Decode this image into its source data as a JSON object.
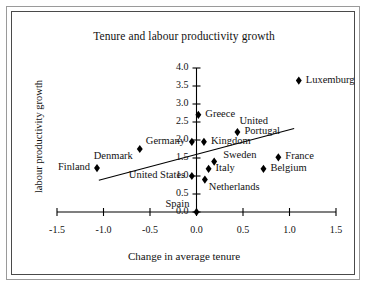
{
  "chart_data": {
    "type": "scatter",
    "title": "Tenure and labour productivity growth",
    "xlabel": "Change in average tenure",
    "ylabel": "labour productivity growth",
    "xlim": [
      -1.5,
      1.5
    ],
    "ylim": [
      0.0,
      4.0
    ],
    "xticks": [
      "-1.5",
      "-1.0",
      "-0.5",
      "0.0",
      "0.5",
      "1.0",
      "1.5"
    ],
    "xtick_values": [
      -1.5,
      -1.0,
      -0.5,
      0.0,
      0.5,
      1.0,
      1.5
    ],
    "yticks": [
      "0.0",
      "0.5",
      "1.0",
      "1.5",
      "2.0",
      "2.5",
      "3.0",
      "3.5",
      "4.0"
    ],
    "ytick_values": [
      0.0,
      0.5,
      1.0,
      1.5,
      2.0,
      2.5,
      3.0,
      3.5,
      4.0
    ],
    "grid": false,
    "legend": "none",
    "marker": "diamond",
    "marker_color": "#000000",
    "points": [
      {
        "label": "Luxemburg",
        "x": 1.1,
        "y": 3.65,
        "label_pos": "right"
      },
      {
        "label": "Greece",
        "x": 0.02,
        "y": 2.7,
        "label_pos": "right"
      },
      {
        "label": "Portugal",
        "x": 0.44,
        "y": 2.22,
        "label_pos": "right"
      },
      {
        "label": "United",
        "x": 0.44,
        "y": 2.22,
        "label_pos": "above-left"
      },
      {
        "label": "Kingdom",
        "x": 0.08,
        "y": 1.95,
        "label_pos": "right"
      },
      {
        "label": "Germany",
        "x": -0.05,
        "y": 1.95,
        "label_pos": "left"
      },
      {
        "label": "Denmark",
        "x": -0.61,
        "y": 1.75,
        "label_pos": "left-below"
      },
      {
        "label": "France",
        "x": 0.88,
        "y": 1.52,
        "label_pos": "right"
      },
      {
        "label": "Sweden",
        "x": 0.19,
        "y": 1.4,
        "label_pos": "right-above"
      },
      {
        "label": "Belgium",
        "x": 0.72,
        "y": 1.2,
        "label_pos": "right"
      },
      {
        "label": "Italy",
        "x": 0.13,
        "y": 1.2,
        "label_pos": "right"
      },
      {
        "label": "Finland",
        "x": -1.07,
        "y": 1.22,
        "label_pos": "left"
      },
      {
        "label": "United States",
        "x": -0.05,
        "y": 1.0,
        "label_pos": "left"
      },
      {
        "label": "Netherlands",
        "x": 0.09,
        "y": 0.9,
        "label_pos": "right-below"
      },
      {
        "label": "Spain",
        "x": 0.0,
        "y": 0.0,
        "label_pos": "left-above"
      }
    ],
    "trendline": {
      "x0": -1.05,
      "y0": 0.88,
      "x1": 1.05,
      "y1": 2.32,
      "color": "#000000"
    }
  },
  "figure": {
    "border_color_outer": "#9a9a9a",
    "border_color_inner": "#4a4a4a",
    "background": "#ffffff"
  }
}
